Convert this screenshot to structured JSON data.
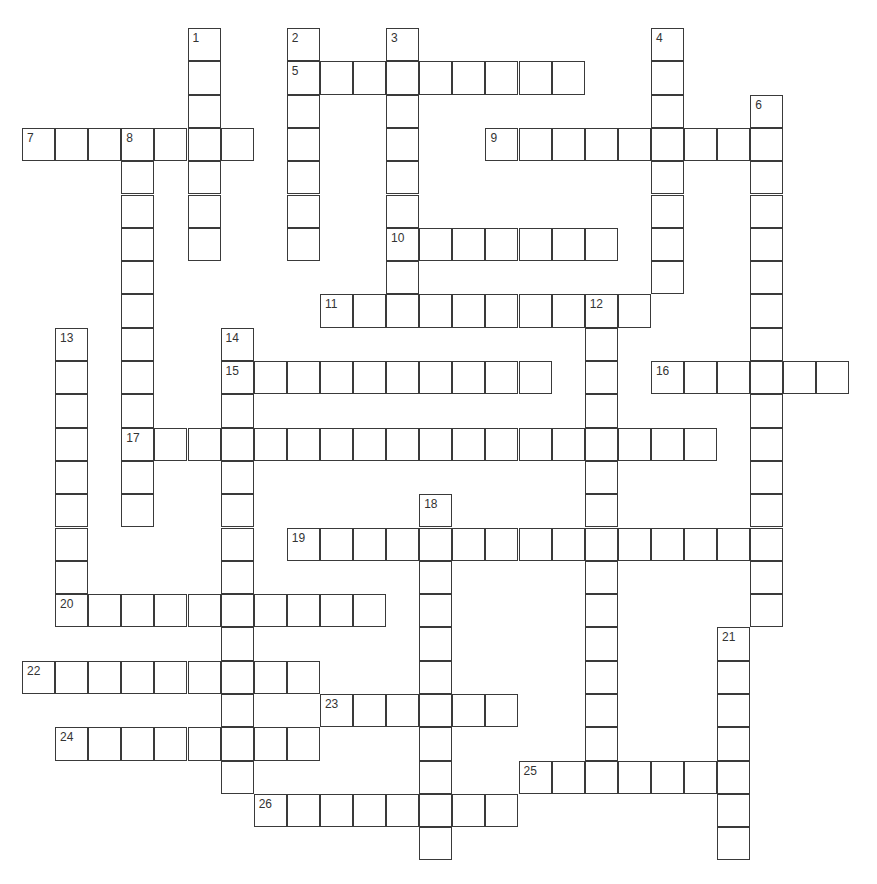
{
  "puzzle": {
    "cell_w": 33.1,
    "cell_h": 33.3,
    "words": [
      {
        "number": 1,
        "dir": "down",
        "row": 0,
        "col": 5,
        "length": 7
      },
      {
        "number": 2,
        "dir": "down",
        "row": 0,
        "col": 8,
        "length": 7
      },
      {
        "number": 3,
        "dir": "down",
        "row": 0,
        "col": 11,
        "length": 9
      },
      {
        "number": 4,
        "dir": "down",
        "row": 0,
        "col": 19,
        "length": 8
      },
      {
        "number": 5,
        "dir": "across",
        "row": 1,
        "col": 8,
        "length": 9
      },
      {
        "number": 6,
        "dir": "down",
        "row": 2,
        "col": 22,
        "length": 16
      },
      {
        "number": 7,
        "dir": "across",
        "row": 3,
        "col": 0,
        "length": 7
      },
      {
        "number": 8,
        "dir": "down",
        "row": 3,
        "col": 3,
        "length": 12
      },
      {
        "number": 9,
        "dir": "across",
        "row": 3,
        "col": 14,
        "length": 9
      },
      {
        "number": 10,
        "dir": "across",
        "row": 6,
        "col": 11,
        "length": 7
      },
      {
        "number": 11,
        "dir": "across",
        "row": 8,
        "col": 9,
        "length": 10
      },
      {
        "number": 12,
        "dir": "down",
        "row": 8,
        "col": 17,
        "length": 15
      },
      {
        "number": 13,
        "dir": "down",
        "row": 9,
        "col": 1,
        "length": 9
      },
      {
        "number": 14,
        "dir": "down",
        "row": 9,
        "col": 6,
        "length": 14
      },
      {
        "number": 15,
        "dir": "across",
        "row": 10,
        "col": 6,
        "length": 10
      },
      {
        "number": 16,
        "dir": "across",
        "row": 10,
        "col": 19,
        "length": 6
      },
      {
        "number": 17,
        "dir": "across",
        "row": 12,
        "col": 3,
        "length": 18
      },
      {
        "number": 18,
        "dir": "down",
        "row": 14,
        "col": 12,
        "length": 11
      },
      {
        "number": 19,
        "dir": "across",
        "row": 15,
        "col": 8,
        "length": 15
      },
      {
        "number": 20,
        "dir": "across",
        "row": 17,
        "col": 1,
        "length": 10
      },
      {
        "number": 21,
        "dir": "down",
        "row": 18,
        "col": 21,
        "length": 7
      },
      {
        "number": 22,
        "dir": "across",
        "row": 19,
        "col": 0,
        "length": 9
      },
      {
        "number": 23,
        "dir": "across",
        "row": 20,
        "col": 9,
        "length": 6
      },
      {
        "number": 24,
        "dir": "across",
        "row": 21,
        "col": 1,
        "length": 8
      },
      {
        "number": 25,
        "dir": "across",
        "row": 22,
        "col": 15,
        "length": 7
      },
      {
        "number": 26,
        "dir": "across",
        "row": 23,
        "col": 7,
        "length": 8
      }
    ]
  },
  "colors": {
    "grid_line": "#3a3a3a",
    "number_text": "#333333",
    "background": "#ffffff"
  }
}
